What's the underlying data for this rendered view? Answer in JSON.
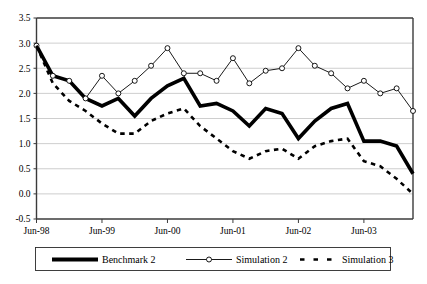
{
  "chart_data": {
    "type": "line",
    "title": "",
    "subtitle": "",
    "xlabel": "",
    "ylabel": "",
    "ylim": [
      -0.5,
      3.5
    ],
    "ytick_labels": [
      "3.5",
      "3.0",
      "2.5",
      "2.0",
      "1.5",
      "1.0",
      "0.5",
      "0.0",
      "-0.5"
    ],
    "ytick_values": [
      3.5,
      3.0,
      2.5,
      2.0,
      1.5,
      1.0,
      0.5,
      0.0,
      -0.5
    ],
    "xtick_labels": [
      "Jun-98",
      "Jun-99",
      "Jun-00",
      "Jun-01",
      "Jun-02",
      "Jun-03"
    ],
    "xtick_values": [
      0,
      4,
      8,
      12,
      16,
      20
    ],
    "x_count": 22,
    "grid": "horizontal",
    "legend_position": "bottom",
    "series": [
      {
        "name": "Benchmark 2",
        "style": "thick-solid",
        "color": "#000000",
        "values": [
          2.95,
          2.35,
          2.25,
          1.9,
          1.75,
          1.9,
          1.55,
          1.9,
          2.15,
          2.3,
          1.75,
          1.8,
          1.65,
          1.35,
          1.7,
          1.6,
          1.1,
          1.45,
          1.7,
          1.8,
          1.05,
          1.05,
          0.95,
          0.4
        ]
      },
      {
        "name": "Simulation 2",
        "style": "thin-solid-circle-markers",
        "color": "#000000",
        "values": [
          2.95,
          2.35,
          2.25,
          1.9,
          2.35,
          2.0,
          2.25,
          2.55,
          2.9,
          2.4,
          2.4,
          2.25,
          2.7,
          2.2,
          2.45,
          2.5,
          2.9,
          2.55,
          2.4,
          2.1,
          2.25,
          2.0,
          2.1,
          1.65
        ]
      },
      {
        "name": "Simulation 3",
        "style": "dotted",
        "color": "#000000",
        "values": [
          2.95,
          2.2,
          1.85,
          1.65,
          1.4,
          1.2,
          1.2,
          1.45,
          1.6,
          1.7,
          1.35,
          1.1,
          0.85,
          0.7,
          0.85,
          0.9,
          0.7,
          0.95,
          1.05,
          1.1,
          0.65,
          0.55,
          0.3,
          0.0
        ]
      }
    ]
  },
  "legend": {
    "items": [
      {
        "label": "Benchmark 2"
      },
      {
        "label": "Simulation 2"
      },
      {
        "label": "Simulation 3"
      }
    ]
  }
}
